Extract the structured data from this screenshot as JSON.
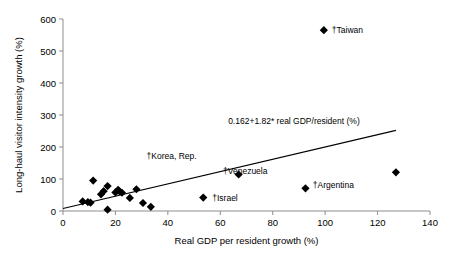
{
  "chart_data": {
    "type": "scatter",
    "title": "",
    "xlabel": "Real GDP per resident growth (%)",
    "ylabel": "Long-haul visitor intensity growth (%)",
    "xlim": [
      0,
      140
    ],
    "ylim": [
      0,
      600
    ],
    "xticks": [
      0,
      20,
      40,
      60,
      80,
      100,
      120,
      140
    ],
    "yticks": [
      0,
      100,
      200,
      300,
      400,
      500,
      600
    ],
    "grid": false,
    "legend": "none",
    "marker_shape": "diamond",
    "marker_color": "#000000",
    "trendline": {
      "label": "0.162+1.82* real GDP/resident (%)",
      "intercept": 0.162,
      "slope": 1.82,
      "x_start": 0,
      "y_start": 8,
      "x_end": 127,
      "y_end": 252,
      "color": "#000000"
    },
    "points": [
      {
        "label": "",
        "x": 7.5,
        "y": 30
      },
      {
        "label": "",
        "x": 9.5,
        "y": 28
      },
      {
        "label": "",
        "x": 10.5,
        "y": 26
      },
      {
        "label": "",
        "x": 11.5,
        "y": 95
      },
      {
        "label": "",
        "x": 14.5,
        "y": 52
      },
      {
        "label": "",
        "x": 15.5,
        "y": 62
      },
      {
        "label": "",
        "x": 17.0,
        "y": 78
      },
      {
        "label": "",
        "x": 17.0,
        "y": 4
      },
      {
        "label": "",
        "x": 20.0,
        "y": 58
      },
      {
        "label": "",
        "x": 21.0,
        "y": 66
      },
      {
        "label": "",
        "x": 21.5,
        "y": 62
      },
      {
        "label": "",
        "x": 22.5,
        "y": 57
      },
      {
        "label": "",
        "x": 25.5,
        "y": 41
      },
      {
        "label": "",
        "x": 28.0,
        "y": 68
      },
      {
        "label": "",
        "x": 30.5,
        "y": 25
      },
      {
        "label": "",
        "x": 33.5,
        "y": 13
      },
      {
        "label": "†Israel",
        "x": 53.5,
        "y": 42,
        "label_dx": 9,
        "label_dy": 3
      },
      {
        "label": "†Korea, Rep.",
        "x": 67.0,
        "y": 114,
        "label_dx": -42,
        "label_dy": -16
      },
      {
        "label": "†Venezuela",
        "x": 92.5,
        "y": 71,
        "label_dx": -38,
        "label_dy": -14
      },
      {
        "label": "†Taiwan",
        "x": 99.5,
        "y": 565,
        "label_dx": 8,
        "label_dy": 3
      },
      {
        "label": "†Argentina",
        "x": 127.0,
        "y": 121,
        "label_dx": -42,
        "label_dy": 16
      }
    ]
  }
}
